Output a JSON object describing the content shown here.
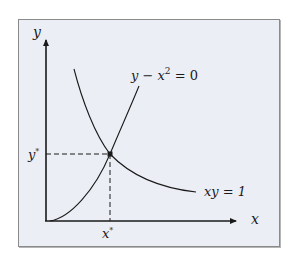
{
  "diagram": {
    "axes": {
      "x_label": "x",
      "y_label": "y"
    },
    "curves": [
      {
        "name": "parabola",
        "equation_lhs": "y − x",
        "equation_exp": "2",
        "equation_rhs": " = 0"
      },
      {
        "name": "hyperbola",
        "equation": "xy = 1"
      }
    ],
    "intersection": {
      "x_label": "x",
      "y_label": "y",
      "star": "*"
    },
    "colors": {
      "background": "#eceef6",
      "frame": "#8a8a8a",
      "ink": "#1a1a1a"
    }
  }
}
